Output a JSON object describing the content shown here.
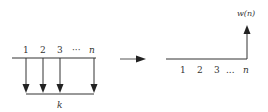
{
  "left_diagram": {
    "labels": [
      "1",
      "2",
      "3",
      "···",
      "n"
    ],
    "bottom_label": "k",
    "arrow_count": 4
  },
  "transition_arrow": {
    "direction": "right"
  },
  "right_diagram": {
    "tick_labels": [
      "1",
      "2",
      "3",
      "...",
      "n"
    ],
    "vertical_label": "w(n)"
  },
  "colors": {
    "stroke": "#333333",
    "background": "#ffffff"
  }
}
